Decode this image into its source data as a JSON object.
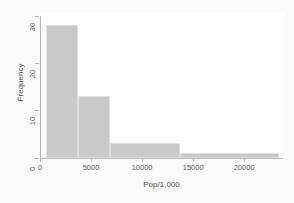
{
  "chart_data": {
    "type": "bar",
    "title": "",
    "subtitle": "",
    "xlabel": "Pop/1,000",
    "ylabel": "Frequency",
    "xlim": [
      0,
      23800
    ],
    "ylim": [
      0,
      30
    ],
    "grid": false,
    "legend": null,
    "bar_color": "#c9c9c9",
    "bar_edge_color": "#dfdfdf",
    "plot_background": "#ffffff",
    "figure_background": "#fbfbfb",
    "axis_color": "#b5b5b5",
    "tick_label_color": "#555555",
    "axis_title_color": "#4d4d4d",
    "xticks": [
      {
        "value": 0,
        "label": "0"
      },
      {
        "value": 5000,
        "label": "5000"
      },
      {
        "value": 10000,
        "label": "10000"
      },
      {
        "value": 15000,
        "label": "15000"
      },
      {
        "value": 20000,
        "label": "20000"
      }
    ],
    "yticks": [
      {
        "value": 0,
        "label": "0"
      },
      {
        "value": 10,
        "label": "10"
      },
      {
        "value": 20,
        "label": "20"
      },
      {
        "value": 30,
        "label": "30"
      }
    ],
    "bins": [
      {
        "x0": 600,
        "x1": 3700,
        "height": 28
      },
      {
        "x0": 3700,
        "x1": 6900,
        "height": 13
      },
      {
        "x0": 6900,
        "x1": 13700,
        "height": 3
      },
      {
        "x0": 13700,
        "x1": 23400,
        "height": 1
      }
    ],
    "categories": [
      "600-3700",
      "3700-6900",
      "6900-13700",
      "13700-23400"
    ],
    "values": [
      28,
      13,
      3,
      1
    ]
  }
}
